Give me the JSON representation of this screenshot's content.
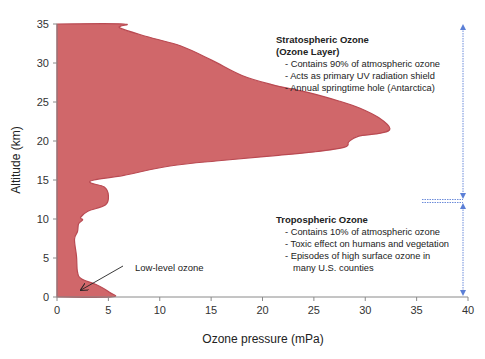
{
  "chart_data": {
    "type": "area",
    "title": "",
    "xlabel": "Ozone pressure (mPa)",
    "ylabel": "Altitude (km)",
    "xlim": [
      0,
      40
    ],
    "ylim": [
      0,
      35
    ],
    "x_ticks": [
      0,
      5,
      10,
      15,
      20,
      25,
      30,
      35,
      40
    ],
    "y_ticks": [
      0,
      5,
      10,
      15,
      20,
      25,
      30,
      35
    ],
    "grid": false,
    "legend": null,
    "fill_color": "#d0676a",
    "edge_color": "#b94a52",
    "series": [
      {
        "name": "Ozone profile",
        "points_x_mPa_y_km": [
          [
            0,
            35
          ],
          [
            6.5,
            35
          ],
          [
            6.1,
            34.5
          ],
          [
            9,
            33.3
          ],
          [
            12,
            32.2
          ],
          [
            15,
            30.4
          ],
          [
            18,
            28.4
          ],
          [
            21,
            27.2
          ],
          [
            24.5,
            26.2
          ],
          [
            27.5,
            25.1
          ],
          [
            29.5,
            24.2
          ],
          [
            31.3,
            23.0
          ],
          [
            32.4,
            21.6
          ],
          [
            31.5,
            21.0
          ],
          [
            29.3,
            20.6
          ],
          [
            28.4,
            19.9
          ],
          [
            28.0,
            19.2
          ],
          [
            25,
            18.6
          ],
          [
            21,
            18.1
          ],
          [
            16,
            17.5
          ],
          [
            11,
            16.8
          ],
          [
            6.5,
            15.6
          ],
          [
            3.6,
            15.0
          ],
          [
            3.3,
            14.6
          ],
          [
            4.6,
            14.1
          ],
          [
            5.0,
            13.0
          ],
          [
            4.7,
            11.8
          ],
          [
            3.0,
            11.0
          ],
          [
            2.3,
            10.2
          ],
          [
            2.5,
            9.9
          ],
          [
            2.1,
            9.4
          ],
          [
            2.0,
            8.4
          ],
          [
            1.7,
            7.4
          ],
          [
            1.9,
            5.2
          ],
          [
            2.0,
            3.2
          ],
          [
            2.4,
            2.3
          ],
          [
            3.8,
            1.6
          ],
          [
            5.1,
            0.6
          ],
          [
            5.3,
            0
          ],
          [
            0,
            0
          ]
        ]
      }
    ],
    "peak": {
      "x_mPa": 32.4,
      "altitude_km": 21.5
    },
    "tropopause_altitude_km": 12,
    "annotations": [
      {
        "id": "stratospheric",
        "title_lines": [
          "Stratospheric Ozone",
          "(Ozone Layer)"
        ],
        "bullets": [
          "Contains 90% of atmospheric ozone",
          "Acts as primary UV radiation shield",
          "Annual springtime hole (Antarctica)"
        ],
        "range_km": [
          12,
          35
        ]
      },
      {
        "id": "tropospheric",
        "title_lines": [
          "Tropospheric Ozone"
        ],
        "bullets": [
          "Contains 10% of atmospheric ozone",
          "Toxic effect on humans and vegetation",
          "Episodes of high surface ozone in",
          "many U.S. counties"
        ],
        "range_km": [
          0,
          12
        ]
      },
      {
        "id": "low-level",
        "text": "Low-level ozone",
        "arrow_to": {
          "x_mPa": 2.2,
          "altitude_km": 0.9
        }
      }
    ],
    "arrow_color": "#5b7fd6"
  },
  "labels": {
    "x_axis_title": "Ozone pressure (mPa)",
    "y_axis_title": "Altitude (km)",
    "x_ticks": [
      "0",
      "5",
      "10",
      "15",
      "20",
      "25",
      "30",
      "35",
      "40"
    ],
    "y_ticks": [
      "0",
      "5",
      "10",
      "15",
      "20",
      "25",
      "30",
      "35"
    ],
    "strat_title_1": "Stratospheric Ozone",
    "strat_title_2": "(Ozone Layer)",
    "strat_b1": "-  Contains 90% of atmospheric ozone",
    "strat_b2": "-  Acts as primary UV radiation shield",
    "strat_b3": "-  Annual springtime hole (Antarctica)",
    "trop_title": "Tropospheric Ozone",
    "trop_b1": "-  Contains 10% of atmospheric ozone",
    "trop_b2": "-  Toxic effect on humans and vegetation",
    "trop_b3": "-  Episodes of high surface ozone in",
    "trop_b4": "many U.S. counties",
    "low_level": "Low-level ozone"
  }
}
